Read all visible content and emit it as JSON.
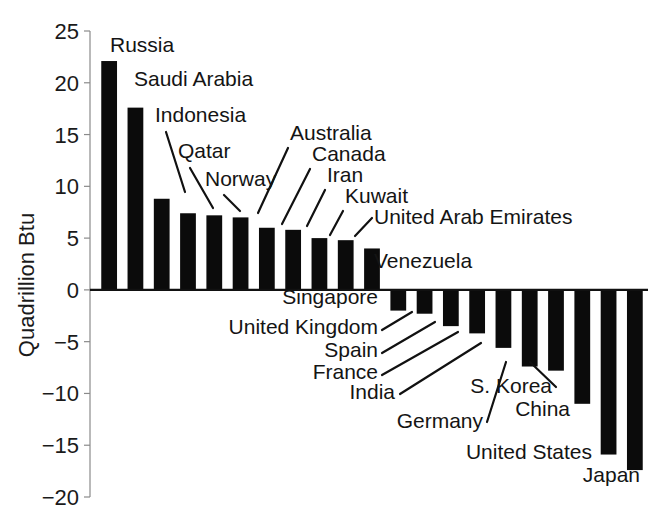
{
  "chart_data": {
    "type": "bar",
    "title": "",
    "subtitle": "",
    "xlabel": "",
    "ylabel": "Quadrillion Btu",
    "ylim": [
      -20,
      25
    ],
    "ytick_step": 5,
    "yticks": [
      "25",
      "20",
      "15",
      "10",
      "5",
      "0",
      "-5",
      "-10",
      "-15",
      "-20"
    ],
    "grid": false,
    "legend": "none",
    "bar_color": "#0b0b0b",
    "orientation": "vertical",
    "note": "Net energy exports (positive) and net imports (negative) by country",
    "categories": [
      "Russia",
      "Saudi Arabia",
      "Indonesia",
      "Qatar",
      "Norway",
      "Australia",
      "Canada",
      "Iran",
      "Kuwait",
      "United Arab Emirates",
      "Venezuela",
      "Singapore",
      "United Kingdom",
      "Spain",
      "France",
      "India",
      "Germany",
      "S. Korea",
      "China",
      "United States",
      "Japan"
    ],
    "values": [
      22.1,
      17.6,
      8.8,
      7.4,
      7.2,
      7.0,
      6.0,
      5.8,
      5.0,
      4.8,
      4.0,
      -2.0,
      -2.3,
      -3.5,
      -4.2,
      -5.6,
      -7.4,
      -7.8,
      -11.0,
      -15.9,
      -17.4
    ],
    "labels": [
      {
        "name": "Russia",
        "value": 22.1,
        "text_x": 110,
        "text_y": 52,
        "anchor": "start",
        "leader": false
      },
      {
        "name": "Saudi Arabia",
        "value": 17.6,
        "text_x": 134,
        "text_y": 86,
        "anchor": "start",
        "leader": false
      },
      {
        "name": "Indonesia",
        "value": 8.8,
        "text_x": 155,
        "text_y": 122,
        "anchor": "start",
        "leader": true,
        "lx1": 166,
        "ly1": 132,
        "lx2": 185,
        "ly2": 192
      },
      {
        "name": "Qatar",
        "value": 7.4,
        "text_x": 178,
        "text_y": 158,
        "anchor": "start",
        "leader": true,
        "lx1": 190,
        "ly1": 168,
        "lx2": 213,
        "ly2": 208
      },
      {
        "name": "Norway",
        "value": 7.2,
        "text_x": 205,
        "text_y": 186,
        "anchor": "start",
        "leader": true,
        "lx1": 224,
        "ly1": 195,
        "lx2": 240,
        "ly2": 211
      },
      {
        "name": "Australia",
        "value": 7.0,
        "text_x": 290,
        "text_y": 140,
        "anchor": "start",
        "leader": true,
        "lx1": 288,
        "ly1": 148,
        "lx2": 258,
        "ly2": 213
      },
      {
        "name": "Canada",
        "value": 6.0,
        "text_x": 312,
        "text_y": 161,
        "anchor": "start",
        "leader": true,
        "lx1": 310,
        "ly1": 169,
        "lx2": 282,
        "ly2": 224
      },
      {
        "name": "Iran",
        "value": 5.8,
        "text_x": 327,
        "text_y": 182,
        "anchor": "start",
        "leader": true,
        "lx1": 325,
        "ly1": 190,
        "lx2": 307,
        "ly2": 226
      },
      {
        "name": "Kuwait",
        "value": 5.0,
        "text_x": 345,
        "text_y": 203,
        "anchor": "start",
        "leader": true,
        "lx1": 343,
        "ly1": 211,
        "lx2": 330,
        "ly2": 235
      },
      {
        "name": "United Arab Emirates",
        "value": 4.8,
        "text_x": 374,
        "text_y": 224,
        "anchor": "start",
        "leader": true,
        "lx1": 372,
        "ly1": 218,
        "lx2": 355,
        "ly2": 236
      },
      {
        "name": "Venezuela",
        "value": 4.0,
        "text_x": 374,
        "text_y": 268,
        "anchor": "start",
        "leader": false
      },
      {
        "name": "Singapore",
        "value": -2.0,
        "text_x": 378,
        "text_y": 304,
        "anchor": "end",
        "leader": false
      },
      {
        "name": "United Kingdom",
        "value": -2.3,
        "text_x": 378,
        "text_y": 334,
        "anchor": "end",
        "leader": true,
        "lx1": 382,
        "ly1": 330,
        "lx2": 412,
        "ly2": 312
      },
      {
        "name": "Spain",
        "value": -3.5,
        "text_x": 378,
        "text_y": 357,
        "anchor": "end",
        "leader": true,
        "lx1": 382,
        "ly1": 353,
        "lx2": 435,
        "ly2": 322
      },
      {
        "name": "France",
        "value": -4.2,
        "text_x": 378,
        "text_y": 379,
        "anchor": "end",
        "leader": true,
        "lx1": 382,
        "ly1": 375,
        "lx2": 458,
        "ly2": 332
      },
      {
        "name": "India",
        "value": -5.6,
        "text_x": 395,
        "text_y": 399,
        "anchor": "end",
        "leader": true,
        "lx1": 400,
        "ly1": 394,
        "lx2": 481,
        "ly2": 343
      },
      {
        "name": "Germany",
        "value": -7.4,
        "text_x": 483,
        "text_y": 428,
        "anchor": "end",
        "leader": true,
        "lx1": 487,
        "ly1": 422,
        "lx2": 506,
        "ly2": 362
      },
      {
        "name": "S. Korea",
        "value": -7.8,
        "text_x": 552,
        "text_y": 393,
        "anchor": "end",
        "leader": true,
        "lx1": 556,
        "ly1": 387,
        "lx2": 530,
        "ly2": 362
      },
      {
        "name": "China",
        "value": -11.0,
        "text_x": 570,
        "text_y": 416,
        "anchor": "end",
        "leader": false
      },
      {
        "name": "United States",
        "value": -15.9,
        "text_x": 592,
        "text_y": 459,
        "anchor": "end",
        "leader": false
      },
      {
        "name": "Japan",
        "value": -17.4,
        "text_x": 640,
        "text_y": 482,
        "anchor": "end",
        "leader": false
      }
    ]
  },
  "axis": {
    "y_title": "Quadrillion Btu",
    "ticks": [
      {
        "label": "25",
        "value": 25
      },
      {
        "label": "20",
        "value": 20
      },
      {
        "label": "15",
        "value": 15
      },
      {
        "label": "10",
        "value": 10
      },
      {
        "label": "5",
        "value": 5
      },
      {
        "label": "0",
        "value": 0
      },
      {
        "label": "−5",
        "value": -5
      },
      {
        "label": "−10",
        "value": -10
      },
      {
        "label": "−15",
        "value": -15
      },
      {
        "label": "−20",
        "value": -20
      }
    ]
  }
}
